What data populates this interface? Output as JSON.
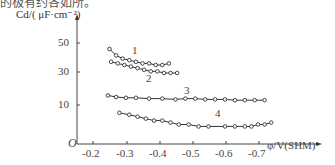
{
  "header": {
    "fragment": "的极有约各如所。"
  },
  "chart_data": {
    "type": "line",
    "title": "",
    "xlabel": "φ/V(SHM)",
    "ylabel": "Cd/( μF·cm⁻²)",
    "origin_label": "O",
    "x_ticks": [
      "-0.2",
      "-0.3",
      "-0.4",
      "-0.5",
      "-0.6",
      "-0.7"
    ],
    "y_ticks": [
      "10",
      "30",
      "50"
    ],
    "xlim": [
      -0.15,
      -0.8
    ],
    "ylim": [
      0,
      60
    ],
    "grid": false,
    "legend": "inline numeric labels 1–4",
    "series": [
      {
        "name": "1",
        "x": [
          -0.25,
          -0.27,
          -0.29,
          -0.31,
          -0.33,
          -0.35,
          -0.37,
          -0.39,
          -0.41,
          -0.43
        ],
        "y": [
          45,
          41,
          39,
          38,
          37,
          36,
          36,
          35,
          35,
          36
        ]
      },
      {
        "name": "2",
        "x": [
          -0.255,
          -0.275,
          -0.295,
          -0.315,
          -0.335,
          -0.355,
          -0.375,
          -0.395,
          -0.415,
          -0.435,
          -0.455
        ],
        "y": [
          37,
          36,
          35,
          34,
          33,
          32,
          31,
          31,
          30,
          30,
          30
        ]
      },
      {
        "name": "3",
        "x": [
          -0.245,
          -0.27,
          -0.3,
          -0.33,
          -0.37,
          -0.41,
          -0.45,
          -0.48,
          -0.51,
          -0.54,
          -0.57,
          -0.6,
          -0.63,
          -0.66,
          -0.69,
          -0.72
        ],
        "y": [
          16,
          15,
          14.5,
          14.5,
          14,
          14,
          13.5,
          14,
          14,
          13.5,
          13.5,
          13.5,
          13,
          13,
          13,
          13
        ]
      },
      {
        "name": "4",
        "x": [
          -0.28,
          -0.31,
          -0.335,
          -0.36,
          -0.385,
          -0.41,
          -0.435,
          -0.46,
          -0.49,
          -0.52,
          -0.55,
          -0.6,
          -0.63,
          -0.66,
          -0.68,
          -0.7,
          -0.72,
          -0.74
        ],
        "y": [
          8,
          7.5,
          7,
          6.5,
          6,
          6,
          5.5,
          5,
          5,
          4.5,
          4.5,
          4.5,
          4.5,
          4.5,
          4.5,
          5,
          5,
          5.5
        ]
      }
    ]
  }
}
